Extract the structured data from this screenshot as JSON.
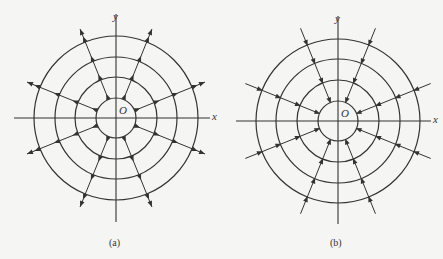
{
  "figure": {
    "background": "#f5f5f3",
    "stroke": "#333333",
    "panels": [
      {
        "id": "a",
        "caption": "(a)",
        "caption_pos": [
          116,
          243
        ],
        "center": [
          116,
          118
        ],
        "ring_radii": [
          20,
          41,
          61,
          82
        ],
        "x_axis": [
          14,
          210
        ],
        "y_axis": [
          14,
          222
        ],
        "labels": {
          "x": "x",
          "y": "y",
          "origin": "O"
        },
        "direction": "outward",
        "ray_angles_deg": [
          22,
          68,
          112,
          158,
          202,
          248,
          292,
          338
        ],
        "ray_outer_length": 96
      },
      {
        "id": "b",
        "caption": "(b)",
        "caption_pos": [
          337,
          243
        ],
        "center": [
          338,
          121
        ],
        "ring_radii": [
          20,
          41,
          62,
          82
        ],
        "x_axis": [
          236,
          431
        ],
        "y_axis": [
          16,
          224
        ],
        "labels": {
          "x": "x",
          "y": "y",
          "origin": "O"
        },
        "direction": "inward",
        "ray_angles_deg": [
          22,
          68,
          112,
          158,
          202,
          248,
          292,
          338
        ],
        "ray_outer_length": 100
      }
    ]
  }
}
